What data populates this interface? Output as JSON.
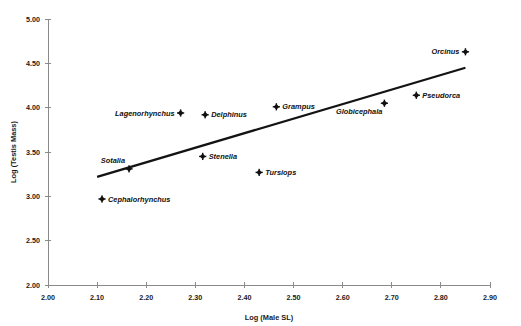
{
  "chart_data": {
    "type": "scatter",
    "title": "",
    "xlabel": "Log (Male SL)",
    "ylabel": "Log (Testis Mass)",
    "xlim": [
      2.0,
      2.9
    ],
    "ylim": [
      2.0,
      5.0
    ],
    "xticks": [
      "2.00",
      "2.10",
      "2.20",
      "2.30",
      "2.40",
      "2.50",
      "2.60",
      "2.70",
      "2.80",
      "2.90"
    ],
    "yticks": [
      "2.00",
      "2.50",
      "3.00",
      "3.50",
      "4.00",
      "4.50",
      "5.00"
    ],
    "grid": false,
    "legend": "none",
    "marker_style": "filled-diamond",
    "points": [
      {
        "label": "Cephalorhynchus",
        "x": 2.11,
        "y": 2.97,
        "label_side": "right"
      },
      {
        "label": "Sotalia",
        "x": 2.165,
        "y": 3.31,
        "label_side": "left-above"
      },
      {
        "label": "Lagenorhynchus",
        "x": 2.27,
        "y": 3.94,
        "label_side": "left"
      },
      {
        "label": "Stenella",
        "x": 2.315,
        "y": 3.45,
        "label_side": "right"
      },
      {
        "label": "Delphinus",
        "x": 2.32,
        "y": 3.92,
        "label_side": "right"
      },
      {
        "label": "Tursiops",
        "x": 2.43,
        "y": 3.27,
        "label_side": "right"
      },
      {
        "label": "Grampus",
        "x": 2.465,
        "y": 4.01,
        "label_side": "right"
      },
      {
        "label": "Globicephala",
        "x": 2.685,
        "y": 4.05,
        "label_side": "left-below"
      },
      {
        "label": "Pseudorca",
        "x": 2.75,
        "y": 4.14,
        "label_side": "right"
      },
      {
        "label": "Orcinus",
        "x": 2.85,
        "y": 4.63,
        "label_side": "left"
      }
    ],
    "trendline": {
      "type": "linear-fit",
      "x_start": 2.1,
      "y_start": 3.22,
      "x_end": 2.85,
      "y_end": 4.45
    },
    "colors": {
      "marker": "#111111",
      "trendline": "#131313",
      "axis": "#8a8a8a",
      "text": "#1a1a1a",
      "background": "#ffffff"
    }
  }
}
